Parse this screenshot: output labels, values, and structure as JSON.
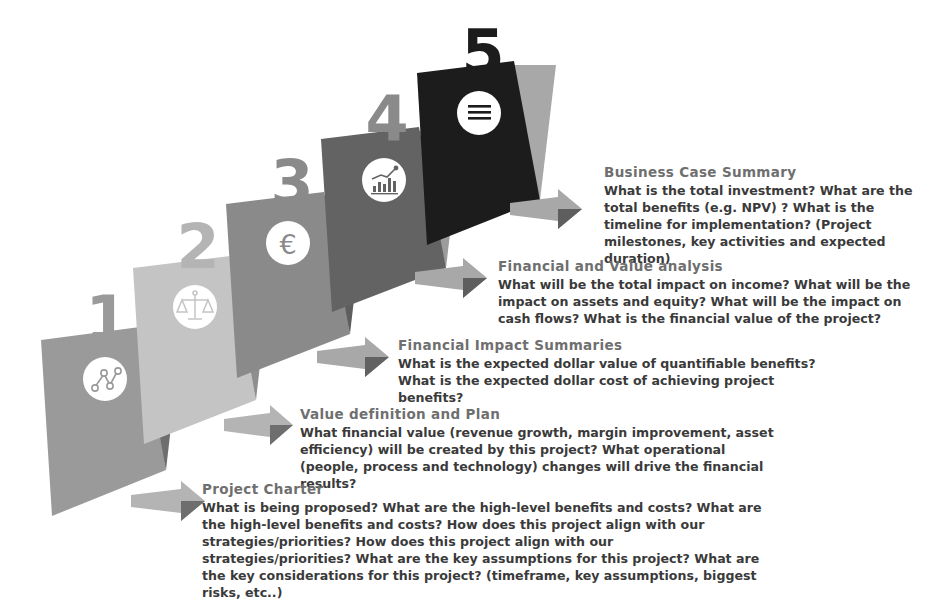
{
  "diagram": {
    "type": "staircase-process",
    "step_count": 5,
    "background_color": "#ffffff",
    "title_color": "#6f6f6f",
    "body_color": "#3a3a3a",
    "steps": [
      {
        "number": "1",
        "title": "Project Charter",
        "body": "What is being proposed? What are the high-level benefits and costs? What are the high-level benefits and costs? How does this project align with our strategies/priorities? How does this project align with our strategies/priorities? What are the key assumptions for this project? What are the key considerations for this project? (timeframe, key assumptions, biggest risks, etc..)",
        "icon": "network-nodes-icon",
        "block_color": "#9a9a9a",
        "shadow_color": "#6e6e6e",
        "number_color": "#9a9a9a",
        "arrow_color": "#b4b4b4",
        "arrow_shadow_color": "#6e6e6e"
      },
      {
        "number": "2",
        "title": "Value definition and Plan",
        "body": "What financial value (revenue growth, margin improvement, asset efficiency) will be created by this project? What operational (people, process and technology) changes will drive the financial results?",
        "icon": "balance-scale-icon",
        "block_color": "#c4c4c4",
        "shadow_color": "#8e8e8e",
        "number_color": "#b4b4b4",
        "arrow_color": "#b4b4b4",
        "arrow_shadow_color": "#6e6e6e"
      },
      {
        "number": "3",
        "title": "Financial Impact Summaries",
        "body": "What is the expected dollar value of quantifiable benefits? What is the expected dollar cost of achieving project benefits?",
        "icon": "euro-currency-icon",
        "block_color": "#8a8a8a",
        "shadow_color": "#5e5e5e",
        "number_color": "#8a8a8a",
        "arrow_color": "#a8a8a8",
        "arrow_shadow_color": "#626262"
      },
      {
        "number": "4",
        "title": "Financial and Value analysis",
        "body": "What will be the total impact on income? What will be the impact on assets and equity? What will be the impact on cash flows? What is the financial value of the project?",
        "icon": "bar-chart-growth-icon",
        "block_color": "#636363",
        "shadow_color": "#9c9c9c",
        "number_color": "#8a8a8a",
        "arrow_color": "#a8a8a8",
        "arrow_shadow_color": "#5e5e5e"
      },
      {
        "number": "5",
        "title": "Business Case Summary",
        "body": "What is the total investment?  What are the total benefits (e.g. NPV) ? What is the timeline for implementation? (Project milestones, key activities and expected duration)",
        "icon": "document-lines-icon",
        "block_color": "#1c1c1c",
        "shadow_color": "#a8a8a8",
        "number_color": "#1c1c1c",
        "arrow_color": "#a8a8a8",
        "arrow_shadow_color": "#5e5e5e"
      }
    ]
  }
}
